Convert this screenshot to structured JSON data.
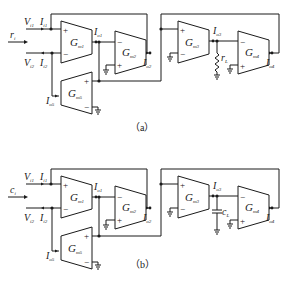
{
  "figure": {
    "panels": [
      {
        "caption": "（a）",
        "input_label": "r",
        "input_sub": "i",
        "load_label": "r",
        "load_sub": "L",
        "load_type": "resistor",
        "labels": {
          "vi1": "V",
          "vi1_sub": "i1",
          "ii1": "I",
          "ii1_sub": "i1",
          "vi2": "V",
          "vi2_sub": "i2",
          "ii2": "I",
          "ii2_sub": "i2",
          "io1": "I",
          "io1_sub": "o1",
          "io2": "I",
          "io2_sub": "o2",
          "io3": "I",
          "io3_sub": "o3",
          "io4": "I",
          "io4_sub": "o4",
          "io5": "I",
          "io5_sub": "o5"
        },
        "amplifiers": [
          {
            "name": "G",
            "sub": "m1",
            "plus": "+",
            "minus": "−"
          },
          {
            "name": "G",
            "sub": "m2",
            "plus": "+",
            "minus": "−"
          },
          {
            "name": "G",
            "sub": "m3",
            "plus": "+",
            "minus": "−"
          },
          {
            "name": "G",
            "sub": "m4",
            "plus": "+",
            "minus": "−"
          },
          {
            "name": "G",
            "sub": "m5",
            "plus": "+",
            "minus": "−"
          }
        ]
      },
      {
        "caption": "（b）",
        "input_label": "c",
        "input_sub": "i",
        "load_label": "c",
        "load_sub": "L",
        "load_type": "capacitor",
        "labels": {
          "vi1": "V",
          "vi1_sub": "i1",
          "ii1": "I",
          "ii1_sub": "i1",
          "vi2": "V",
          "vi2_sub": "i2",
          "ii2": "I",
          "ii2_sub": "i2",
          "io1": "I",
          "io1_sub": "o1",
          "io2": "I",
          "io2_sub": "o2",
          "io3": "I",
          "io3_sub": "o3",
          "io4": "I",
          "io4_sub": "o4",
          "io5": "I",
          "io5_sub": "o5"
        },
        "amplifiers": [
          {
            "name": "G",
            "sub": "m1",
            "plus": "+",
            "minus": "−"
          },
          {
            "name": "G",
            "sub": "m2",
            "plus": "+",
            "minus": "−"
          },
          {
            "name": "G",
            "sub": "m3",
            "plus": "+",
            "minus": "−"
          },
          {
            "name": "G",
            "sub": "m4",
            "plus": "+",
            "minus": "−"
          },
          {
            "name": "G",
            "sub": "m5",
            "plus": "+",
            "minus": "−"
          }
        ]
      }
    ],
    "colors": {
      "line": "#1a1a1a",
      "background": "#ffffff"
    }
  }
}
